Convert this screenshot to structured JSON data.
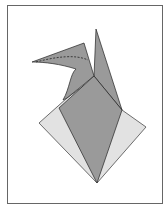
{
  "diagram": {
    "type": "origami-step",
    "frame": {
      "stroke": "#555555",
      "fill": "#ffffff"
    },
    "colors": {
      "dark_paper": "#9a9a9a",
      "light_paper": "#e2e2e2",
      "line": "#222222"
    }
  }
}
